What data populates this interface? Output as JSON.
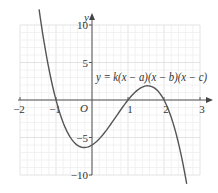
{
  "chart_data": {
    "type": "line",
    "title": "",
    "equation_label": "y = k(x − a)(x − b)(x − c)",
    "xlabel": "",
    "ylabel": "y",
    "origin_label": "O",
    "xlim": [
      -2,
      3
    ],
    "ylim": [
      -10,
      10
    ],
    "x_ticks": [
      -2,
      -1,
      1,
      2,
      3
    ],
    "x_tick_labels": [
      "−2",
      "−1",
      "1",
      "2",
      "3"
    ],
    "y_ticks": [
      10,
      5,
      -5,
      -10
    ],
    "y_tick_labels": [
      "10",
      "5",
      "−5",
      "−10"
    ],
    "grid": true,
    "grid_minor_x": 0.2,
    "grid_minor_y": 1,
    "series": [
      {
        "name": "y = k(x − a)(x − b)(x − c)",
        "function": "cubic",
        "k": -3,
        "roots": [
          -1,
          1,
          2
        ],
        "x_range": [
          -1.47,
          2.63
        ],
        "x": [
          -1.47,
          -1.0,
          -0.5,
          -0.215,
          0.0,
          0.5,
          1.0,
          1.549,
          2.0,
          2.5,
          2.63
        ],
        "y": [
          10.0,
          0.0,
          -5.63,
          -6.34,
          -6.0,
          -3.38,
          0.0,
          1.89,
          0.0,
          -7.88,
          -10.0
        ]
      }
    ],
    "annotations": [
      {
        "text": "y = k(x − a)(x − b)(x − c)",
        "x": 0.1,
        "y": 2.6
      }
    ]
  },
  "colors": {
    "curve": "#555555",
    "axis": "#555555",
    "grid": "#e6e6e6",
    "text": "#333333"
  }
}
